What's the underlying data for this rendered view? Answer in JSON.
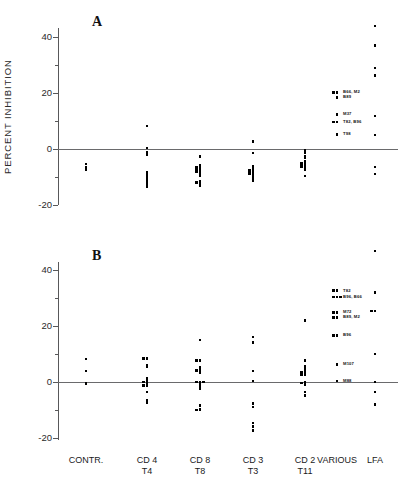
{
  "figure": {
    "y_axis_title": "PERCENT INHIBITION",
    "panel_a_letter": "A",
    "panel_b_letter": "B"
  },
  "x_categories": [
    {
      "line1": "CONTR.",
      "line2": ""
    },
    {
      "line1": "CD 4",
      "line2": "T4"
    },
    {
      "line1": "CD 8",
      "line2": "T8"
    },
    {
      "line1": "CD 3",
      "line2": "T3"
    },
    {
      "line1": "CD 2",
      "line2": "T11"
    },
    {
      "line1": "VARIOUS",
      "line2": ""
    },
    {
      "line1": "LFA",
      "line2": ""
    }
  ],
  "y_ticks": [
    {
      "value": 40,
      "label": "40"
    },
    {
      "value": 20,
      "label": "20"
    },
    {
      "value": 0,
      "label": "0"
    },
    {
      "value": -20,
      "label": "-20"
    }
  ],
  "y_minor_ticks": [
    30,
    10,
    -10
  ],
  "annotations_a": [
    {
      "text": "B66, M2",
      "value": 20.2
    },
    {
      "text": "B89",
      "value": 18.4
    },
    {
      "text": "M37",
      "value": 12.4
    },
    {
      "text": "T82, B96",
      "value": 9.6
    },
    {
      "text": "T98",
      "value": 5.2
    }
  ],
  "annotations_b": [
    {
      "text": "T82",
      "value": 32.6
    },
    {
      "text": "B96, B66",
      "value": 30.4
    },
    {
      "text": "M72",
      "value": 24.8
    },
    {
      "text": "B89, M2",
      "value": 23.0
    },
    {
      "text": "B96",
      "value": 16.6
    },
    {
      "text": "M107",
      "value": 6.2
    },
    {
      "text": "M88",
      "value": 0.4
    }
  ],
  "chart_data": {
    "type": "scatter",
    "title": "",
    "xlabel": "",
    "ylabel": "PERCENT INHIBITION",
    "ylim": [
      -25,
      48
    ],
    "grid": false,
    "legend": "none",
    "reference_line": 0,
    "categories": [
      "CONTR.",
      "CD 4 / T4",
      "CD 8 / T8",
      "CD 3 / T3",
      "CD 2 / T11",
      "VARIOUS",
      "LFA"
    ],
    "panels": [
      {
        "name": "A",
        "label": "A",
        "series": [
          {
            "category": "CONTR.",
            "values": [
              -5.4,
              -6.6,
              -7.4
            ]
          },
          {
            "category": "CD 4 / T4",
            "values": [
              8.2,
              0.4,
              -1.0,
              -1.6,
              -2.2,
              -8.2,
              -9.2,
              -9.8,
              -10.4,
              -11.0,
              -11.8,
              -12.6,
              -13.4
            ]
          },
          {
            "category": "CD 8 / T8",
            "values": [
              -2.6,
              -5.8,
              -6.4,
              -6.4,
              -7.0,
              -7.0,
              -7.6,
              -7.6,
              -8.2,
              -8.2,
              -8.8,
              -9.4,
              -11.4,
              -12.0,
              -12.0,
              -12.6,
              -13.2
            ]
          },
          {
            "category": "CD 3 / T3",
            "values": [
              2.6,
              -1.4,
              -6.0,
              -7.0,
              -7.6,
              -7.6,
              -8.2,
              -8.2,
              -8.8,
              -8.8,
              -9.4,
              -10.0,
              -10.6,
              -11.2
            ]
          },
          {
            "category": "CD 2 / T11",
            "values": [
              -0.6,
              -1.2,
              -2.6,
              -3.2,
              -4.4,
              -5.0,
              -5.0,
              -5.6,
              -5.6,
              -6.2,
              -6.2,
              -6.8,
              -7.4,
              -9.6
            ]
          },
          {
            "category": "VARIOUS",
            "values": [
              20.2,
              20.2,
              18.4,
              12.4,
              9.6,
              9.6,
              5.2
            ]
          },
          {
            "category": "LFA",
            "values": [
              44.0,
              37.0,
              29.0,
              26.2,
              11.8,
              5.0,
              -6.4,
              -9.0
            ]
          }
        ]
      },
      {
        "name": "B",
        "label": "B",
        "series": [
          {
            "category": "CONTR.",
            "values": [
              8.2,
              4.0,
              -0.6
            ]
          },
          {
            "category": "CD 4 / T4",
            "values": [
              8.4,
              8.4,
              6.0,
              5.4,
              1.2,
              0.4,
              0.0,
              0.0,
              -0.6,
              -1.2,
              -1.2,
              -3.6,
              -6.4,
              -7.4
            ]
          },
          {
            "category": "CD 8 / T8",
            "values": [
              15.0,
              7.6,
              7.6,
              5.2,
              4.2,
              4.2,
              3.4,
              0.0,
              0.0,
              0.0,
              -0.8,
              -1.6,
              -2.4,
              -8.4,
              -9.6,
              -10.0,
              -10.0
            ]
          },
          {
            "category": "CD 3 / T3",
            "values": [
              16.0,
              14.2,
              4.0,
              0.4,
              -7.6,
              -9.0,
              -14.6,
              -15.8,
              -17.4
            ]
          },
          {
            "category": "CD 2 / T11",
            "values": [
              22.0,
              7.6,
              5.6,
              5.0,
              4.2,
              3.4,
              3.4,
              2.6,
              2.6,
              0.0,
              -0.4,
              -0.4,
              -1.0,
              -3.6,
              -4.8
            ]
          },
          {
            "category": "VARIOUS",
            "values": [
              32.6,
              32.6,
              30.4,
              30.4,
              30.4,
              24.8,
              24.8,
              23.0,
              23.0,
              16.6,
              16.6,
              6.2,
              0.4
            ]
          },
          {
            "category": "LFA",
            "values": [
              46.8,
              32.0,
              25.4,
              25.4,
              10.0,
              0.0,
              -3.6,
              -8.0
            ]
          }
        ]
      }
    ]
  }
}
